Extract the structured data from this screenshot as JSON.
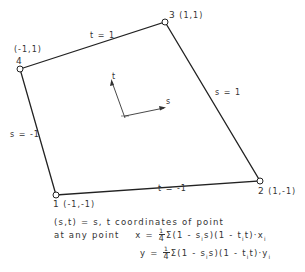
{
  "diagram": {
    "nodes": [
      {
        "id": "1",
        "coords": "(-1,-1)",
        "x": 56,
        "y": 195
      },
      {
        "id": "2",
        "coords": "(1,-1)",
        "x": 260,
        "y": 181
      },
      {
        "id": "3",
        "coords": "(1,1)",
        "x": 165,
        "y": 22
      },
      {
        "id": "4",
        "coords": "(-1,1)",
        "x": 20,
        "y": 69
      }
    ],
    "edges": [
      {
        "label": "t = 1",
        "from": "4",
        "to": "3"
      },
      {
        "label": "s = 1",
        "from": "3",
        "to": "2"
      },
      {
        "label": "t = -1",
        "from": "1",
        "to": "2"
      },
      {
        "label": "s = -1",
        "from": "4",
        "to": "1"
      }
    ],
    "axes": {
      "s_label": "s",
      "t_label": "t"
    }
  },
  "text": {
    "line1": "(s,t) = s, t  coordinates  of  point",
    "line2_prefix": "at  any  point",
    "x_lhs": "x =",
    "y_lhs": "y =",
    "frac_num": "1",
    "frac_den": "4",
    "sum_x": "Σ(1 - s",
    "sum_x_mid": "s)(1 - t",
    "sum_x_end": "t)·x",
    "sub_i": "i"
  }
}
